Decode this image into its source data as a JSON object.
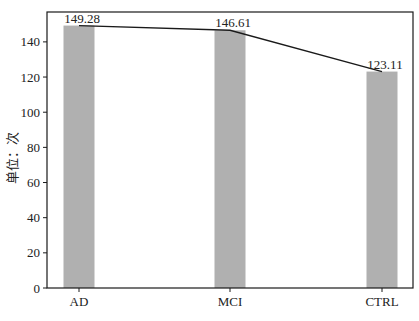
{
  "chart_data": {
    "type": "bar",
    "title": "",
    "xlabel": "",
    "ylabel": "单位：次",
    "categories": [
      "AD",
      "MCI",
      "CTRL"
    ],
    "values": [
      149.28,
      146.61,
      123.11
    ],
    "data_labels": [
      "149.28",
      "146.61",
      "123.11"
    ],
    "overlay_line": {
      "type": "line",
      "values": [
        149.28,
        146.61,
        123.11
      ],
      "color": "#1a1a1a"
    },
    "ylim": [
      0,
      157
    ],
    "yticks": [
      0,
      20,
      40,
      60,
      80,
      100,
      120,
      140
    ],
    "grid": false,
    "legend": null,
    "bar_color": "#b0b0b0"
  }
}
